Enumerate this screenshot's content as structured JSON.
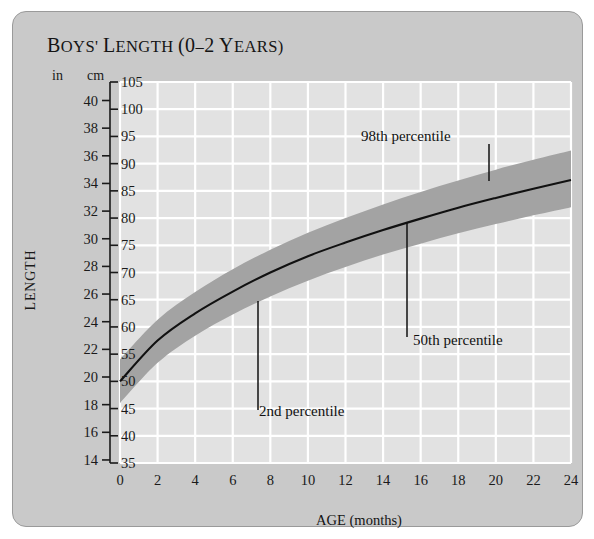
{
  "chart_data": {
    "type": "area",
    "title": "BOYS' LENGTH (0–2 YEARS)",
    "title_main": "B",
    "title_rest": "OYS",
    "xlabel": "AGE (months)",
    "ylabel": "LENGTH",
    "unit_left": "in",
    "unit_right": "cm",
    "x": [
      0,
      2,
      4,
      6,
      8,
      10,
      12,
      14,
      16,
      18,
      20,
      22,
      24
    ],
    "xlim": [
      0,
      24
    ],
    "xticks": [
      "0",
      "2",
      "4",
      "6",
      "8",
      "10",
      "12",
      "14",
      "16",
      "18",
      "20",
      "22",
      "24"
    ],
    "ylim_cm": [
      35,
      105
    ],
    "yticks_cm": [
      "105",
      "100",
      "95",
      "90",
      "85",
      "80",
      "75",
      "70",
      "65",
      "60",
      "55",
      "50",
      "45",
      "40",
      "35"
    ],
    "yticks_in": [
      "40",
      "38",
      "36",
      "34",
      "32",
      "30",
      "28",
      "26",
      "24",
      "22",
      "20",
      "18",
      "16",
      "14"
    ],
    "yticks_in_values": [
      40,
      38,
      36,
      34,
      32,
      30,
      28,
      26,
      24,
      22,
      20,
      18,
      16,
      14
    ],
    "yticks_cm_values": [
      105,
      100,
      95,
      90,
      85,
      80,
      75,
      70,
      65,
      60,
      55,
      50,
      45,
      40,
      35
    ],
    "grid": true,
    "grid_color": "#ffffff",
    "plot_bg": "#e2e2e2",
    "band_color": "#a3a3a3",
    "line_color": "#111111",
    "series": [
      {
        "name": "50th percentile",
        "values_cm": [
          50.0,
          57.5,
          62.5,
          66.5,
          70.0,
          73.0,
          75.5,
          77.8,
          79.9,
          81.9,
          83.7,
          85.4,
          87.0
        ]
      },
      {
        "name": "98th percentile",
        "values_cm": [
          54.0,
          61.3,
          66.4,
          70.6,
          74.2,
          77.3,
          80.0,
          82.5,
          84.8,
          86.9,
          88.9,
          90.7,
          92.4
        ]
      },
      {
        "name": "2nd percentile",
        "values_cm": [
          46.0,
          53.4,
          58.4,
          62.3,
          65.6,
          68.5,
          71.0,
          73.3,
          75.3,
          77.2,
          78.9,
          80.5,
          82.0
        ]
      }
    ],
    "annotations": [
      {
        "label": "98th percentile",
        "x_px": 360,
        "y_px": 140,
        "leader_x": 488,
        "leader_y1": 143,
        "leader_y2": 180
      },
      {
        "label": "50th percentile",
        "x_px": 412,
        "y_px": 344,
        "leader_x": 406,
        "leader_y1": 222,
        "leader_y2": 336
      },
      {
        "label": "2nd percentile",
        "x_px": 258,
        "y_px": 415,
        "leader_x": 257,
        "leader_y1": 300,
        "leader_y2": 409
      }
    ]
  }
}
